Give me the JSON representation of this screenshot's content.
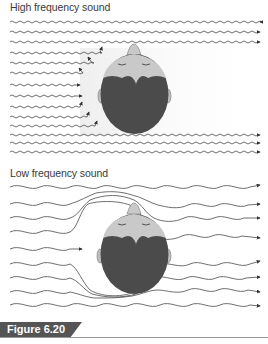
{
  "figure": {
    "label": "Figure 6.20",
    "label_bg": "#555555"
  },
  "panels": [
    {
      "id": "high-frequency",
      "title": "High frequency sound",
      "description": "Short wavelength waves are blocked by the head; waves reaching the head are reflected, leaving a sound shadow on the far side.",
      "wave_count": 14
    },
    {
      "id": "low-frequency",
      "title": "Low frequency sound",
      "description": "Long wavelength waves bend (diffract) around the head and continue to the far side.",
      "wave_count": 9
    }
  ],
  "colors": {
    "wave": "#4a4a4a",
    "hair": "#4b4b4b",
    "face": "#c9c9c9",
    "shadow": "#f0f0f0"
  }
}
